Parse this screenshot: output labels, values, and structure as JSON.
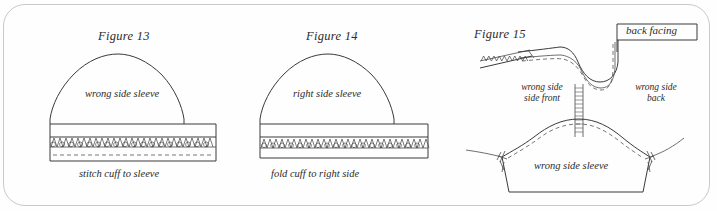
{
  "page": {
    "background_color": "#fefefe",
    "border_color": "#c9c9c9",
    "ink_color": "#3a3a3a"
  },
  "figures": [
    {
      "id": "figure-13",
      "title": "Figure 13",
      "inner_label": "wrong side sleeve",
      "caption": "stitch cuff to sleeve",
      "has_dashed_foldline": true
    },
    {
      "id": "figure-14",
      "title": "Figure 14",
      "inner_label": "right side sleeve",
      "caption": "fold cuff to right side",
      "has_dashed_foldline": false
    },
    {
      "id": "figure-15",
      "title": "Figure 15",
      "labels": {
        "back_facing": "back facing",
        "left_line1": "wrong side",
        "left_line2": "side front",
        "right_line1": "wrong side",
        "right_line2": "back",
        "sleeve": "wrong side sleeve"
      }
    }
  ]
}
